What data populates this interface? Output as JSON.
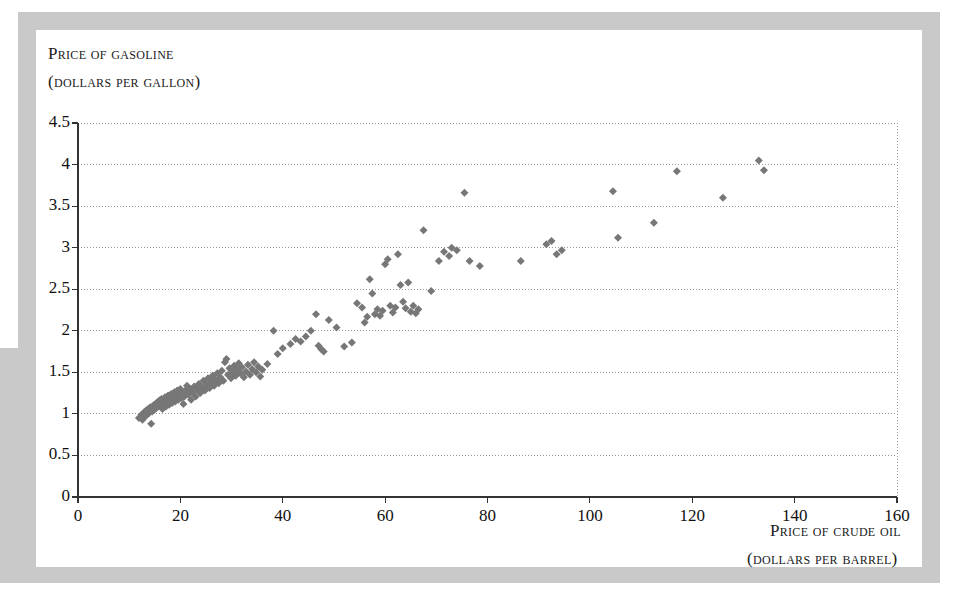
{
  "figure": {
    "background_color": "#ffffff",
    "frame_color": "#c9c9c9",
    "marker_color": "#777777",
    "axis_color": "#333333",
    "grid_color": "#9a9a9a"
  },
  "axis_titles": {
    "y_line1": "Price of gasoline",
    "y_line2": "(dollars per gallon)",
    "x_line1": "Price of crude oil",
    "x_line2": "(dollars per barrel)"
  },
  "chart_data": {
    "type": "scatter",
    "title": "",
    "subtitle": "",
    "xlabel": "Price of crude oil (dollars per barrel)",
    "ylabel": "Price of gasoline (dollars per gallon)",
    "xlim": [
      0,
      160
    ],
    "ylim": [
      0,
      4.5
    ],
    "xticks": [
      0,
      20,
      40,
      60,
      80,
      100,
      120,
      140,
      160
    ],
    "yticks": [
      0,
      0.5,
      1,
      1.5,
      2,
      2.5,
      3,
      3.5,
      4,
      4.5
    ],
    "xtick_labels": [
      "0",
      "20",
      "40",
      "60",
      "80",
      "100",
      "120",
      "140",
      "160"
    ],
    "ytick_labels": [
      "0",
      "0.5",
      "1",
      "1.5",
      "2",
      "2.5",
      "3",
      "3.5",
      "4",
      "4.5"
    ],
    "grid": "horizontal-dotted",
    "legend": "none",
    "marker": "diamond",
    "marker_size": 8,
    "series": [
      {
        "name": "Monthly price observations",
        "points": [
          [
            11.9,
            0.95
          ],
          [
            12.4,
            0.99
          ],
          [
            12.6,
            0.93
          ],
          [
            12.9,
            1.02
          ],
          [
            13.1,
            0.97
          ],
          [
            13.3,
            1.04
          ],
          [
            13.5,
            0.99
          ],
          [
            13.7,
            1.06
          ],
          [
            13.9,
            1.01
          ],
          [
            14.1,
            1.08
          ],
          [
            14.3,
            0.88
          ],
          [
            14.5,
            1.03
          ],
          [
            14.7,
            1.1
          ],
          [
            14.9,
            1.05
          ],
          [
            15.1,
            1.12
          ],
          [
            15.3,
            1.07
          ],
          [
            15.5,
            1.14
          ],
          [
            15.7,
            1.09
          ],
          [
            15.9,
            1.16
          ],
          [
            16.1,
            1.11
          ],
          [
            16.3,
            1.18
          ],
          [
            16.5,
            1.06
          ],
          [
            16.8,
            1.13
          ],
          [
            17.0,
            1.2
          ],
          [
            17.2,
            1.09
          ],
          [
            17.4,
            1.16
          ],
          [
            17.6,
            1.22
          ],
          [
            17.8,
            1.11
          ],
          [
            18.0,
            1.18
          ],
          [
            18.2,
            1.24
          ],
          [
            18.4,
            1.13
          ],
          [
            18.6,
            1.2
          ],
          [
            18.8,
            1.26
          ],
          [
            19.0,
            1.15
          ],
          [
            19.2,
            1.22
          ],
          [
            19.4,
            1.28
          ],
          [
            19.6,
            1.17
          ],
          [
            19.8,
            1.24
          ],
          [
            20.0,
            1.3
          ],
          [
            20.2,
            1.19
          ],
          [
            20.4,
            1.26
          ],
          [
            20.6,
            1.12
          ],
          [
            20.8,
            1.21
          ],
          [
            21.0,
            1.28
          ],
          [
            21.3,
            1.34
          ],
          [
            21.6,
            1.23
          ],
          [
            21.9,
            1.3
          ],
          [
            22.1,
            1.17
          ],
          [
            22.4,
            1.26
          ],
          [
            22.7,
            1.33
          ],
          [
            23.0,
            1.21
          ],
          [
            23.3,
            1.29
          ],
          [
            23.6,
            1.36
          ],
          [
            23.9,
            1.25
          ],
          [
            24.2,
            1.32
          ],
          [
            24.5,
            1.4
          ],
          [
            24.8,
            1.28
          ],
          [
            25.1,
            1.35
          ],
          [
            25.4,
            1.43
          ],
          [
            25.7,
            1.31
          ],
          [
            26.0,
            1.38
          ],
          [
            26.3,
            1.46
          ],
          [
            26.6,
            1.34
          ],
          [
            26.9,
            1.41
          ],
          [
            27.2,
            1.49
          ],
          [
            27.5,
            1.37
          ],
          [
            27.8,
            1.44
          ],
          [
            28.1,
            1.52
          ],
          [
            28.4,
            1.4
          ],
          [
            28.7,
            1.62
          ],
          [
            29.0,
            1.66
          ],
          [
            29.3,
            1.47
          ],
          [
            29.6,
            1.55
          ],
          [
            29.9,
            1.43
          ],
          [
            30.2,
            1.5
          ],
          [
            30.5,
            1.58
          ],
          [
            30.8,
            1.46
          ],
          [
            31.1,
            1.53
          ],
          [
            31.4,
            1.61
          ],
          [
            31.7,
            1.49
          ],
          [
            32.0,
            1.56
          ],
          [
            32.4,
            1.44
          ],
          [
            32.8,
            1.51
          ],
          [
            33.2,
            1.59
          ],
          [
            33.6,
            1.47
          ],
          [
            34.0,
            1.54
          ],
          [
            34.4,
            1.62
          ],
          [
            34.8,
            1.5
          ],
          [
            35.2,
            1.57
          ],
          [
            35.6,
            1.45
          ],
          [
            36.0,
            1.53
          ],
          [
            37.0,
            1.6
          ],
          [
            38.2,
            2.0
          ],
          [
            39.0,
            1.72
          ],
          [
            40.0,
            1.79
          ],
          [
            41.5,
            1.84
          ],
          [
            42.5,
            1.9
          ],
          [
            43.5,
            1.87
          ],
          [
            44.5,
            1.93
          ],
          [
            45.5,
            2.0
          ],
          [
            46.5,
            2.2
          ],
          [
            47.0,
            1.82
          ],
          [
            47.5,
            1.78
          ],
          [
            48.0,
            1.75
          ],
          [
            49.0,
            2.13
          ],
          [
            50.5,
            2.04
          ],
          [
            52.0,
            1.81
          ],
          [
            53.5,
            1.86
          ],
          [
            54.5,
            2.33
          ],
          [
            55.5,
            2.28
          ],
          [
            56.0,
            2.1
          ],
          [
            56.5,
            2.17
          ],
          [
            57.0,
            2.62
          ],
          [
            57.5,
            2.45
          ],
          [
            58.0,
            2.2
          ],
          [
            58.5,
            2.26
          ],
          [
            59.0,
            2.18
          ],
          [
            59.5,
            2.24
          ],
          [
            60.0,
            2.8
          ],
          [
            60.5,
            2.86
          ],
          [
            61.0,
            2.3
          ],
          [
            61.5,
            2.22
          ],
          [
            62.0,
            2.28
          ],
          [
            62.5,
            2.92
          ],
          [
            63.0,
            2.55
          ],
          [
            63.5,
            2.35
          ],
          [
            64.0,
            2.27
          ],
          [
            64.5,
            2.58
          ],
          [
            65.0,
            2.23
          ],
          [
            65.5,
            2.3
          ],
          [
            66.0,
            2.21
          ],
          [
            66.5,
            2.26
          ],
          [
            67.5,
            3.21
          ],
          [
            69.0,
            2.48
          ],
          [
            70.5,
            2.84
          ],
          [
            71.5,
            2.95
          ],
          [
            72.5,
            2.9
          ],
          [
            73.0,
            3.0
          ],
          [
            74.0,
            2.97
          ],
          [
            75.5,
            3.66
          ],
          [
            76.5,
            2.84
          ],
          [
            78.5,
            2.78
          ],
          [
            86.5,
            2.84
          ],
          [
            91.5,
            3.04
          ],
          [
            92.5,
            3.08
          ],
          [
            93.5,
            2.92
          ],
          [
            94.5,
            2.97
          ],
          [
            104.5,
            3.68
          ],
          [
            105.5,
            3.12
          ],
          [
            112.5,
            3.3
          ],
          [
            117.0,
            3.92
          ],
          [
            126.0,
            3.6
          ],
          [
            133.0,
            4.05
          ],
          [
            134.0,
            3.93
          ]
        ]
      }
    ]
  }
}
